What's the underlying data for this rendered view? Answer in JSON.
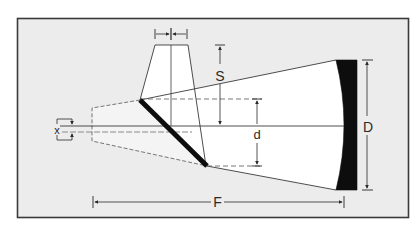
{
  "diagram": {
    "labels": {
      "secondary_width": "l",
      "secondary_offset": "S",
      "secondary_diameter": "d",
      "primary_diameter": "D",
      "focal_length": "F",
      "focus_offset": "x"
    },
    "colors": {
      "page_background": "#ffffff",
      "frame_fill": "#ececec",
      "frame_border": "#3a3a3a",
      "light_cone_fill": "#ffffff",
      "mirror_fill": "#0d0d0d",
      "line_color": "#3a3a3a",
      "dashed_line_color": "#555555",
      "axis_offset_color": "#8a8a8a"
    },
    "components": [
      "primary-mirror",
      "secondary-diagonal-mirror",
      "secondary-holder-trapezoid",
      "light-cone",
      "focal-plane-cone",
      "optical-axis"
    ]
  }
}
